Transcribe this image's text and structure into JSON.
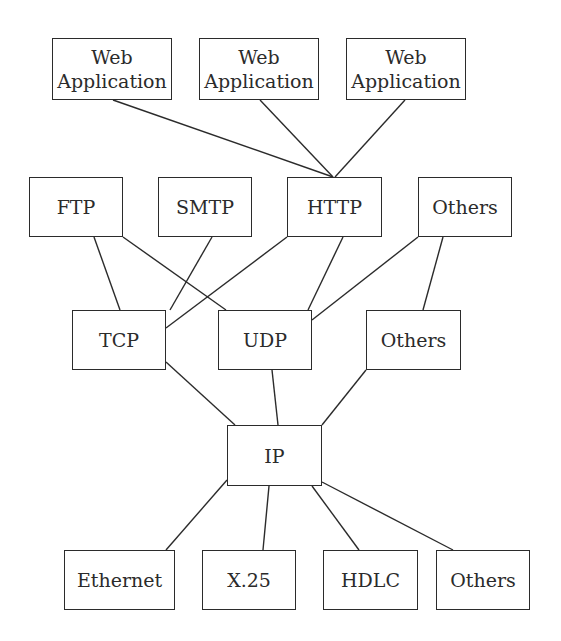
{
  "diagram": {
    "type": "protocol-stack-graph",
    "colors": {
      "line": "#2b2b2b",
      "box_border": "#2b2b2b",
      "background": "#ffffff",
      "text": "#2b2b2b"
    },
    "nodes": [
      {
        "id": "webapp1",
        "label": "Web\nApplication",
        "x": 52,
        "y": 38,
        "w": 120,
        "h": 62,
        "layer": "application-clients"
      },
      {
        "id": "webapp2",
        "label": "Web\nApplication",
        "x": 199,
        "y": 38,
        "w": 120,
        "h": 62,
        "layer": "application-clients"
      },
      {
        "id": "webapp3",
        "label": "Web\nApplication",
        "x": 346,
        "y": 38,
        "w": 120,
        "h": 62,
        "layer": "application-clients"
      },
      {
        "id": "ftp",
        "label": "FTP",
        "x": 29,
        "y": 177,
        "w": 94,
        "h": 60,
        "layer": "application"
      },
      {
        "id": "smtp",
        "label": "SMTP",
        "x": 158,
        "y": 177,
        "w": 94,
        "h": 60,
        "layer": "application"
      },
      {
        "id": "http",
        "label": "HTTP",
        "x": 287,
        "y": 177,
        "w": 95,
        "h": 60,
        "layer": "application"
      },
      {
        "id": "app_others",
        "label": "Others",
        "x": 418,
        "y": 177,
        "w": 94,
        "h": 60,
        "layer": "application"
      },
      {
        "id": "tcp",
        "label": "TCP",
        "x": 72,
        "y": 310,
        "w": 94,
        "h": 60,
        "layer": "transport"
      },
      {
        "id": "udp",
        "label": "UDP",
        "x": 218,
        "y": 310,
        "w": 94,
        "h": 60,
        "layer": "transport"
      },
      {
        "id": "transport_others",
        "label": "Others",
        "x": 366,
        "y": 310,
        "w": 95,
        "h": 60,
        "layer": "transport"
      },
      {
        "id": "ip",
        "label": "IP",
        "x": 227,
        "y": 425,
        "w": 95,
        "h": 61,
        "layer": "network"
      },
      {
        "id": "ethernet",
        "label": "Ethernet",
        "x": 64,
        "y": 550,
        "w": 111,
        "h": 60,
        "layer": "link"
      },
      {
        "id": "x25",
        "label": "X.25",
        "x": 202,
        "y": 550,
        "w": 94,
        "h": 60,
        "layer": "link"
      },
      {
        "id": "hdlc",
        "label": "HDLC",
        "x": 323,
        "y": 550,
        "w": 95,
        "h": 60,
        "layer": "link"
      },
      {
        "id": "link_others",
        "label": "Others",
        "x": 436,
        "y": 550,
        "w": 94,
        "h": 60,
        "layer": "link"
      }
    ],
    "edges": [
      {
        "from": "webapp1",
        "to": "http",
        "x1": 113,
        "y1": 100,
        "x2": 333,
        "y2": 177
      },
      {
        "from": "webapp2",
        "to": "http",
        "x1": 260,
        "y1": 100,
        "x2": 333,
        "y2": 177
      },
      {
        "from": "webapp3",
        "to": "http",
        "x1": 405,
        "y1": 100,
        "x2": 335,
        "y2": 177
      },
      {
        "from": "ftp",
        "to": "tcp",
        "x1": 94,
        "y1": 237,
        "x2": 120,
        "y2": 310
      },
      {
        "from": "ftp",
        "to": "udp",
        "x1": 123,
        "y1": 237,
        "x2": 226,
        "y2": 310
      },
      {
        "from": "smtp",
        "to": "tcp",
        "x1": 212,
        "y1": 237,
        "x2": 170,
        "y2": 310
      },
      {
        "from": "http",
        "to": "tcp",
        "x1": 287,
        "y1": 237,
        "x2": 166,
        "y2": 328
      },
      {
        "from": "http",
        "to": "udp",
        "x1": 343,
        "y1": 237,
        "x2": 308,
        "y2": 310
      },
      {
        "from": "app_others",
        "to": "udp",
        "x1": 418,
        "y1": 237,
        "x2": 312,
        "y2": 320
      },
      {
        "from": "app_others",
        "to": "transport_others",
        "x1": 443,
        "y1": 237,
        "x2": 423,
        "y2": 310
      },
      {
        "from": "tcp",
        "to": "ip",
        "x1": 166,
        "y1": 362,
        "x2": 235,
        "y2": 425
      },
      {
        "from": "udp",
        "to": "ip",
        "x1": 272,
        "y1": 370,
        "x2": 278,
        "y2": 425
      },
      {
        "from": "transport_others",
        "to": "ip",
        "x1": 366,
        "y1": 370,
        "x2": 322,
        "y2": 425
      },
      {
        "from": "ip",
        "to": "ethernet",
        "x1": 227,
        "y1": 480,
        "x2": 166,
        "y2": 550
      },
      {
        "from": "ip",
        "to": "x25",
        "x1": 269,
        "y1": 486,
        "x2": 263,
        "y2": 550
      },
      {
        "from": "ip",
        "to": "hdlc",
        "x1": 312,
        "y1": 486,
        "x2": 359,
        "y2": 550
      },
      {
        "from": "ip",
        "to": "link_others",
        "x1": 322,
        "y1": 482,
        "x2": 453,
        "y2": 550
      }
    ]
  }
}
